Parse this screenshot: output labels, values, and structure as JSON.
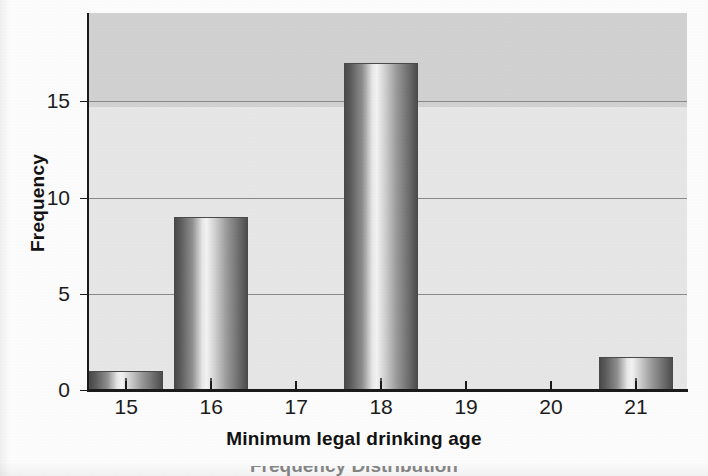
{
  "chart_data": {
    "type": "bar",
    "title": "",
    "xlabel": "Minimum legal drinking age",
    "ylabel": "Frequency",
    "categories": [
      "15",
      "16",
      "17",
      "18",
      "19",
      "20",
      "21"
    ],
    "values": [
      1,
      9,
      0,
      17,
      0,
      0,
      1.7
    ],
    "xtick_labels": [
      "15",
      "16",
      "17",
      "18",
      "19",
      "20",
      "21"
    ],
    "ytick_labels": [
      "0",
      "5",
      "10",
      "15"
    ],
    "ytick_values": [
      0,
      5,
      10,
      15
    ],
    "ylim": [
      0,
      19.6
    ],
    "xlim": [
      14.55,
      21.6
    ],
    "grid": "horizontal",
    "legend": "none",
    "bar_style": "cylindrical-gradient-grayscale",
    "plot_background": "#e2e2e2",
    "bar_edge_color": "#4a4a4a",
    "axis_color": "#1a1a1a",
    "gridline_color": "#8a8a8a",
    "bars": [
      {
        "category": "15",
        "value": 1
      },
      {
        "category": "16",
        "value": 9
      },
      {
        "category": "18",
        "value": 17
      },
      {
        "category": "21",
        "value": 1.7
      }
    ]
  },
  "caption": {
    "clipped_bottom_text": "Frequency Distribution"
  }
}
